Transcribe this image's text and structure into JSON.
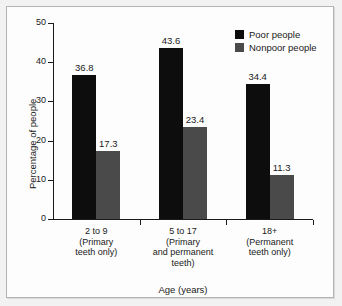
{
  "chart_data": {
    "type": "bar",
    "title": "",
    "subtitle": "",
    "xlabel": "Age (years)",
    "ylabel": "Percentage of people",
    "categories": [
      "2 to 9\n(Primary\nteeth only)",
      "5 to 17\n(Primary\nand permanent\nteeth)",
      "18+\n(Permanent\nteeth only)"
    ],
    "category_lines": [
      [
        "2 to 9",
        "(Primary",
        "teeth only)"
      ],
      [
        "5 to 17",
        "(Primary",
        "and permanent",
        "teeth)"
      ],
      [
        "18+",
        "(Permanent",
        "teeth only)"
      ]
    ],
    "series": [
      {
        "name": "Poor people",
        "color": "#0d0d0d",
        "values": [
          36.8,
          43.6,
          34.4
        ]
      },
      {
        "name": "Nonpoor people",
        "color": "#4a4a4a",
        "values": [
          17.3,
          23.4,
          11.3
        ]
      }
    ],
    "ylim": [
      0,
      50
    ],
    "yticks": [
      0,
      10,
      20,
      30,
      40,
      50
    ],
    "ytick_labels": [
      "0",
      "10",
      "20",
      "30",
      "40",
      "50"
    ],
    "grid": false,
    "legend_position": "top-right",
    "data_labels": true
  },
  "legend": {
    "items": [
      {
        "label": "Poor people",
        "swatch": "poor"
      },
      {
        "label": "Nonpoor people",
        "swatch": "nonpoor"
      }
    ]
  },
  "axes": {
    "x_title": "Age (years)",
    "y_title": "Percentage of people"
  }
}
